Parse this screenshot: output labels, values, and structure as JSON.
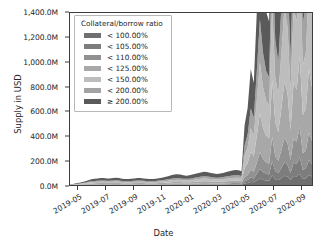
{
  "chart_data": {
    "type": "area",
    "stacked": true,
    "title": "",
    "xlabel": "Date",
    "ylabel": "Supply in USD",
    "grid": false,
    "legend_position": "upper left",
    "legend_title": "Collateral/borrow ratio",
    "ylim": [
      0,
      1500000000
    ],
    "ytick_values": [
      0,
      200000000,
      400000000,
      600000000,
      800000000,
      1000000000,
      1200000000,
      1400000000
    ],
    "ytick_labels": [
      "0.0M",
      "200.0M",
      "400.0M",
      "600.0M",
      "800.0M",
      "1,000.0M",
      "1,200.0M",
      "1,400.0M"
    ],
    "xtick_labels": [
      "2019-05",
      "2019-07",
      "2019-09",
      "2019-11",
      "2020-01",
      "2020-03",
      "2020-05",
      "2020-07",
      "2020-09"
    ],
    "xlim": [
      "2019-04-10",
      "2020-09-05"
    ],
    "colors": [
      "#6f6f6f",
      "#7d7d7d",
      "#919191",
      "#a8a8a8",
      "#bdbdbd",
      "#a3a3a3",
      "#5a5a5a"
    ],
    "series": [
      {
        "name": "< 100.00%",
        "color": "#6f6f6f",
        "values": [
          0.2,
          0.3,
          0.4,
          0.5,
          0.7,
          0.9,
          1.1,
          1.3,
          1.4,
          1.5,
          1.6,
          1.6,
          1.5,
          1.5,
          1.6,
          1.7,
          1.6,
          1.4,
          1.3,
          1.3,
          1.4,
          1.5,
          1.6,
          1.6,
          1.5,
          1.4,
          1.3,
          1.3,
          1.4,
          1.5,
          1.6,
          1.8,
          2.0,
          2.2,
          2.4,
          2.5,
          2.4,
          2.2,
          2.1,
          2.2,
          2.4,
          2.6,
          2.8,
          3.0,
          3.1,
          3.0,
          2.8,
          2.6,
          2.5,
          2.6,
          2.8,
          3.0,
          3.2,
          3.4,
          3.5,
          3.4,
          3.2,
          3.0,
          2.9,
          3.0,
          3.2,
          3.4,
          3.6,
          3.8,
          4.0,
          4.2,
          4.4,
          4.6,
          4.8,
          5.0,
          5.2,
          5.4,
          5.6,
          5.8,
          6.0,
          6.2,
          6.4,
          6.6,
          6.8,
          7.0
        ]
      },
      {
        "name": "< 105.00%",
        "color": "#7d7d7d",
        "values": [
          0.3,
          0.4,
          0.6,
          0.8,
          1.0,
          1.3,
          1.6,
          1.9,
          2.1,
          2.2,
          2.3,
          2.3,
          2.2,
          2.2,
          2.3,
          2.4,
          2.3,
          2.1,
          2.0,
          2.0,
          2.1,
          2.2,
          2.3,
          2.3,
          2.2,
          2.1,
          2.0,
          2.0,
          2.1,
          2.2,
          2.4,
          2.6,
          2.9,
          3.2,
          3.4,
          3.5,
          3.4,
          3.2,
          3.1,
          3.2,
          3.4,
          3.7,
          4.0,
          4.2,
          4.3,
          4.2,
          4.0,
          3.8,
          3.7,
          3.8,
          4.0,
          4.3,
          4.6,
          4.8,
          5.0,
          4.9,
          4.6,
          4.4,
          4.3,
          4.4,
          4.6,
          4.9,
          5.2,
          5.5,
          5.8,
          6.1,
          6.4,
          6.7,
          7.0,
          7.3,
          7.6,
          7.9,
          8.2,
          8.5,
          8.8,
          9.1,
          9.4,
          9.7,
          10.0,
          10.3
        ]
      },
      {
        "name": "< 110.00%",
        "color": "#919191",
        "values": [
          0.5,
          0.7,
          1.0,
          1.4,
          1.8,
          2.3,
          2.8,
          3.3,
          3.6,
          3.8,
          4.0,
          4.0,
          3.8,
          3.8,
          4.0,
          4.2,
          4.0,
          3.6,
          3.4,
          3.4,
          3.6,
          3.8,
          4.0,
          4.0,
          3.8,
          3.6,
          3.4,
          3.4,
          3.6,
          3.9,
          4.2,
          4.6,
          5.1,
          5.6,
          6.0,
          6.2,
          6.0,
          5.6,
          5.4,
          5.6,
          6.0,
          6.5,
          7.0,
          7.4,
          7.6,
          7.4,
          7.0,
          6.6,
          6.4,
          6.6,
          7.0,
          7.5,
          8.0,
          8.4,
          8.7,
          8.5,
          8.0,
          7.6,
          7.5,
          7.7,
          8.1,
          8.6,
          9.1,
          9.6,
          10.1,
          10.6,
          11.2,
          11.8,
          12.4,
          13.0,
          13.6,
          14.2,
          14.8,
          15.4,
          16.0,
          16.6,
          17.2,
          17.8,
          18.4,
          19.0
        ]
      },
      {
        "name": "< 125.00%",
        "color": "#a8a8a8",
        "values": [
          1.0,
          1.5,
          2.2,
          3.0,
          4.0,
          5.2,
          6.4,
          7.6,
          8.4,
          8.9,
          9.3,
          9.3,
          8.9,
          8.9,
          9.3,
          9.8,
          9.3,
          8.4,
          7.9,
          7.9,
          8.4,
          8.9,
          9.3,
          9.3,
          8.9,
          8.4,
          7.9,
          7.9,
          8.4,
          9.1,
          9.8,
          10.7,
          11.9,
          13.0,
          14.0,
          14.4,
          14.0,
          13.0,
          12.6,
          13.0,
          14.0,
          15.1,
          16.3,
          17.2,
          17.7,
          17.2,
          16.3,
          15.4,
          14.9,
          15.4,
          16.3,
          17.5,
          18.6,
          19.5,
          20.2,
          19.8,
          18.6,
          17.7,
          17.5,
          17.9,
          18.8,
          20.0,
          21.2,
          22.3,
          23.5,
          24.7,
          26.0,
          27.4,
          28.8,
          30.2,
          31.6,
          33.0,
          34.4,
          35.8,
          37.2,
          38.6,
          40.0,
          41.4,
          42.8,
          44.2
        ]
      },
      {
        "name": "< 150.00%",
        "color": "#bdbdbd",
        "values": [
          1.2,
          1.9,
          2.8,
          3.9,
          5.2,
          6.8,
          8.4,
          10.0,
          11.0,
          11.7,
          12.2,
          12.2,
          11.7,
          11.7,
          12.2,
          12.9,
          12.2,
          11.0,
          10.4,
          10.4,
          11.0,
          11.7,
          12.2,
          12.2,
          11.7,
          11.0,
          10.4,
          10.4,
          11.0,
          11.9,
          12.9,
          14.1,
          15.6,
          17.1,
          18.4,
          18.9,
          18.4,
          17.1,
          16.5,
          17.1,
          18.4,
          19.9,
          21.4,
          22.6,
          23.3,
          22.6,
          21.4,
          20.2,
          19.6,
          20.2,
          21.4,
          23.0,
          24.5,
          25.7,
          26.6,
          26.0,
          24.5,
          23.3,
          23.0,
          23.5,
          24.7,
          26.3,
          27.8,
          29.4,
          30.9,
          32.5,
          34.2,
          36.0,
          37.9,
          39.7,
          41.5,
          43.4,
          45.2,
          47.1,
          48.9,
          50.8,
          52.6,
          54.5,
          56.3,
          58.2
        ]
      },
      {
        "name": "< 200.00%",
        "color": "#a3a3a3",
        "values": [
          1.0,
          1.6,
          2.4,
          3.3,
          4.4,
          5.7,
          7.1,
          8.4,
          9.3,
          9.8,
          10.3,
          10.3,
          9.8,
          9.8,
          10.3,
          10.8,
          10.3,
          9.3,
          8.8,
          8.8,
          9.3,
          9.8,
          10.3,
          10.3,
          9.8,
          9.3,
          8.8,
          8.8,
          9.3,
          10.0,
          10.8,
          11.8,
          13.1,
          14.4,
          15.5,
          15.9,
          15.5,
          14.4,
          13.9,
          14.4,
          15.5,
          16.7,
          18.0,
          19.0,
          19.6,
          19.0,
          18.0,
          17.0,
          16.5,
          17.0,
          18.0,
          19.3,
          20.6,
          21.6,
          22.3,
          21.9,
          20.6,
          19.6,
          19.3,
          19.8,
          20.8,
          22.1,
          23.4,
          24.7,
          26.0,
          27.3,
          28.7,
          30.3,
          31.8,
          33.4,
          34.9,
          36.5,
          38.0,
          39.6,
          41.1,
          42.7,
          44.2,
          45.8,
          47.3,
          48.9
        ]
      },
      {
        "name": "≥ 200.00%",
        "color": "#5a5a5a",
        "values": [
          2.0,
          3.2,
          4.8,
          6.6,
          8.8,
          11.5,
          14.2,
          16.8,
          18.6,
          19.7,
          20.6,
          20.6,
          19.7,
          19.7,
          20.6,
          21.7,
          20.6,
          18.6,
          17.5,
          17.5,
          18.6,
          19.7,
          20.6,
          20.6,
          19.7,
          18.6,
          17.5,
          17.5,
          18.6,
          20.1,
          21.7,
          23.7,
          26.3,
          28.8,
          31.0,
          31.9,
          31.0,
          28.8,
          27.8,
          28.8,
          31.0,
          33.4,
          36.0,
          38.0,
          39.2,
          38.0,
          36.0,
          34.0,
          33.0,
          34.0,
          36.0,
          38.6,
          41.1,
          43.2,
          44.7,
          43.8,
          41.1,
          39.2,
          38.6,
          39.5,
          41.5,
          44.2,
          46.8,
          49.4,
          52.0,
          54.6,
          57.4,
          60.5,
          63.6,
          66.7,
          69.7,
          72.9,
          75.9,
          79.1,
          82.2,
          85.3,
          88.4,
          91.5,
          94.6,
          97.7
        ]
      }
    ],
    "annotations": [
      {
        "text": "baseline supply rises slowly to ~80M through 2019-07 to 2020-05"
      },
      {
        "text": "local bump to ~110M near 2020-02"
      },
      {
        "text": "sharp growth starting 2020-06 peaking near 1,500M in 2020-07"
      }
    ]
  },
  "legend": {
    "title": "Collateral/borrow ratio",
    "entries": [
      {
        "label": "< 100.00%",
        "color": "#6f6f6f"
      },
      {
        "label": "< 105.00%",
        "color": "#7d7d7d"
      },
      {
        "label": "< 110.00%",
        "color": "#919191"
      },
      {
        "label": "< 125.00%",
        "color": "#a8a8a8"
      },
      {
        "label": "< 150.00%",
        "color": "#bdbdbd"
      },
      {
        "label": "< 200.00%",
        "color": "#a3a3a3"
      },
      {
        "label": "≥ 200.00%",
        "color": "#5a5a5a"
      }
    ]
  },
  "axes": {
    "y_label": "Supply in USD",
    "x_label": "Date",
    "y_ticks": [
      "1,400.0M",
      "1,200.0M",
      "1,000.0M",
      "800.0M",
      "600.0M",
      "400.0M",
      "200.0M",
      "0.0M"
    ],
    "x_ticks": [
      "2019-05",
      "2019-07",
      "2019-09",
      "2019-11",
      "2020-01",
      "2020-03",
      "2020-05",
      "2020-07",
      "2020-09"
    ]
  }
}
